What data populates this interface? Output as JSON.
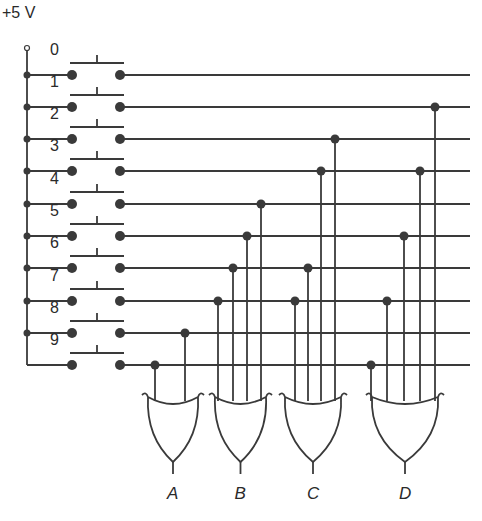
{
  "supply_label": "+5 V",
  "colors": {
    "ink": "#3a3a3a",
    "background": "#ffffff"
  },
  "switches": [
    {
      "label": "0",
      "y": 75
    },
    {
      "label": "1",
      "y": 107
    },
    {
      "label": "2",
      "y": 139
    },
    {
      "label": "3",
      "y": 171
    },
    {
      "label": "4",
      "y": 204
    },
    {
      "label": "5",
      "y": 236
    },
    {
      "label": "6",
      "y": 268
    },
    {
      "label": "7",
      "y": 301
    },
    {
      "label": "8",
      "y": 333
    },
    {
      "label": "9",
      "y": 365
    }
  ],
  "gates": [
    {
      "output": "A",
      "type": "OR",
      "left": 146,
      "right": 200,
      "taps": [
        {
          "line": 9,
          "x": 155
        },
        {
          "line": 8,
          "x": 185
        }
      ]
    },
    {
      "output": "B",
      "type": "OR",
      "left": 213,
      "right": 268,
      "taps": [
        {
          "line": 7,
          "x": 218
        },
        {
          "line": 6,
          "x": 233
        },
        {
          "line": 5,
          "x": 247
        },
        {
          "line": 4,
          "x": 261
        }
      ]
    },
    {
      "output": "C",
      "type": "OR",
      "left": 283,
      "right": 343,
      "taps": [
        {
          "line": 7,
          "x": 295
        },
        {
          "line": 6,
          "x": 308
        },
        {
          "line": 3,
          "x": 321
        },
        {
          "line": 2,
          "x": 335
        }
      ]
    },
    {
      "output": "D",
      "type": "OR",
      "left": 370,
      "right": 440,
      "taps": [
        {
          "line": 9,
          "x": 371
        },
        {
          "line": 7,
          "x": 387
        },
        {
          "line": 5,
          "x": 404
        },
        {
          "line": 3,
          "x": 420
        },
        {
          "line": 1,
          "x": 435
        }
      ]
    }
  ]
}
